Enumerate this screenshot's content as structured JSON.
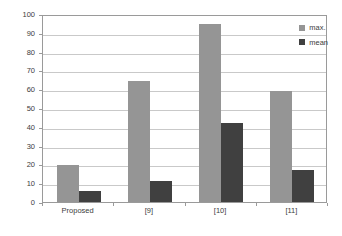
{
  "chart_data": {
    "type": "bar",
    "title": "",
    "xlabel": "",
    "ylabel": "",
    "categories": [
      "Proposed",
      "[9]",
      "[10]",
      "[11]"
    ],
    "series": [
      {
        "name": "max.",
        "color": "#959595",
        "values": [
          19.5,
          64.5,
          94.5,
          59
        ]
      },
      {
        "name": "mean",
        "color": "#404040",
        "values": [
          6,
          11,
          42,
          17
        ]
      }
    ],
    "ylim": [
      0,
      100
    ],
    "yticks": [
      0,
      10,
      20,
      30,
      40,
      50,
      60,
      70,
      80,
      90,
      100
    ],
    "ytick_labels": [
      "0",
      "10",
      "20",
      "30",
      "40",
      "50",
      "60",
      "70",
      "80",
      "90",
      "100"
    ],
    "grid": true,
    "grid_axis": "y",
    "legend_position": "top-right",
    "legend_entries": [
      "max.",
      "mean"
    ],
    "plot_border": "#9a9a9a",
    "gridline_color": "#c9c9c9",
    "background": "#ffffff"
  }
}
